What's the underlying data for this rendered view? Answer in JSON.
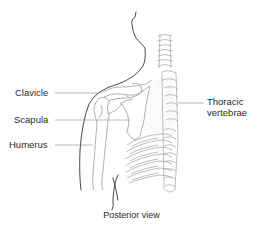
{
  "diagram": {
    "type": "anatomical-illustration",
    "labels": {
      "clavicle": "Clavicle",
      "scapula": "Scapula",
      "humerus": "Humerus",
      "thoracic_line1": "Thoracic",
      "thoracic_line2": "vertebrae"
    },
    "caption": "Posterior view",
    "colors": {
      "outline": "#333333",
      "bone": "#9a9a9a",
      "leader": "#8c8c8c",
      "stipple": "#cfcfcf",
      "text": "#2a2a2a"
    }
  }
}
